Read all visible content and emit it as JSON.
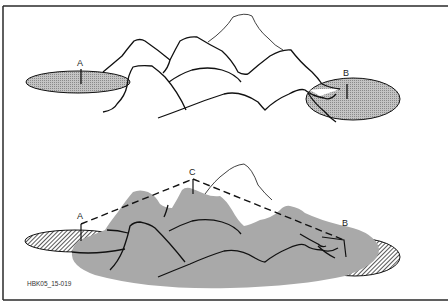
{
  "figure": {
    "id_label": "HBK05_15-019",
    "colors": {
      "frame": "#2a2a2a",
      "line": "#111111",
      "shade_fill": "#a9a9a9",
      "stipple_fill": "#b5b5b5",
      "background": "#ffffff"
    },
    "top_panel": {
      "description": "Mountain outline range with two stippled elliptical viewpoint areas",
      "labels": {
        "a": "A",
        "b": "B"
      }
    },
    "bottom_panel": {
      "description": "Same mountain range with shaded visible terrain, hatched areas, dashed sightlines from A and B to summit C",
      "labels": {
        "a": "A",
        "b": "B",
        "c": "C"
      }
    }
  }
}
